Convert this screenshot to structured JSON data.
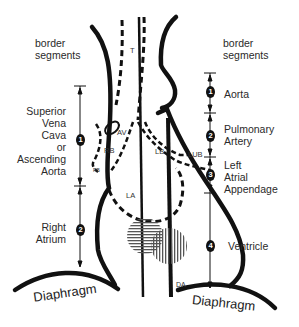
{
  "diagram": {
    "left_header": [
      "border",
      "segments"
    ],
    "right_header": [
      "border",
      "segments"
    ],
    "left_segments": [
      {
        "number": "1",
        "label": [
          "Superior",
          "Vena",
          "Cava",
          "or",
          "Ascending",
          "Aorta"
        ]
      },
      {
        "number": "2",
        "label": [
          "Right",
          "Atrium"
        ]
      }
    ],
    "right_segments": [
      {
        "number": "1",
        "label": [
          "Aorta"
        ]
      },
      {
        "number": "2",
        "label": [
          "Pulmonary",
          "Artery"
        ]
      },
      {
        "number": "3",
        "label": [
          "Left",
          "Atrial",
          "Appendage"
        ]
      },
      {
        "number": "4",
        "label": [
          "Ventricle"
        ]
      }
    ],
    "structure_labels": {
      "trachea": "T",
      "azygos_vein": "AV",
      "right_bronchus": "RB",
      "right_lower_bronchus": "RB",
      "left_bronchus": "LB",
      "left_upper_bronchus": "LUB",
      "left_atrium": "LA",
      "descending_aorta": "DA"
    },
    "diaphragm_left": "Diaphragm",
    "diaphragm_right": "Diaphragm",
    "colors": {
      "line": "#111111",
      "text": "#2a2a2a",
      "background": "#ffffff"
    }
  }
}
